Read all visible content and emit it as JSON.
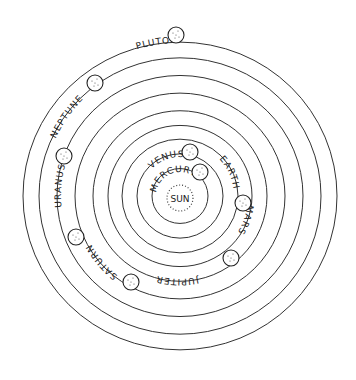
{
  "diagram": {
    "type": "solar-system-orbits",
    "center": {
      "x": 180,
      "y": 192
    },
    "sun": {
      "label": "SUN",
      "radius": 13
    },
    "planets": [
      {
        "name": "MERCURY",
        "orbit_r": 28,
        "pos": {
          "x": 200,
          "y": 172
        },
        "label_angle": -112
      },
      {
        "name": "VENUS",
        "orbit_r": 43,
        "pos": {
          "x": 190,
          "y": 152
        },
        "label_angle": -110
      },
      {
        "name": "EARTH",
        "orbit_r": 58,
        "pos": {
          "x": 243,
          "y": 203
        },
        "label_angle": -25
      },
      {
        "name": "MARS",
        "orbit_r": 72,
        "pos": {
          "x": 231,
          "y": 258
        },
        "label_angle": 20
      },
      {
        "name": "JUPITER",
        "orbit_r": 87,
        "pos": {
          "x": 131,
          "y": 282
        },
        "label_angle": 92
      },
      {
        "name": "SATURN",
        "orbit_r": 105,
        "pos": {
          "x": 76,
          "y": 237
        },
        "label_angle": 140
      },
      {
        "name": "URANUS",
        "orbit_r": 123,
        "pos": {
          "x": 64,
          "y": 156
        },
        "label_angle": 185
      },
      {
        "name": "NEPTUNE",
        "orbit_r": 141,
        "pos": {
          "x": 95,
          "y": 83
        },
        "label_angle": 215
      },
      {
        "name": "PLUTO",
        "orbit_r": 157,
        "pos": {
          "x": 176,
          "y": 35
        },
        "label_angle": 260
      }
    ]
  }
}
